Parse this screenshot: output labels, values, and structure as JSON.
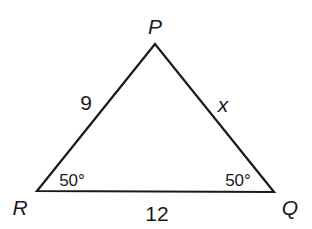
{
  "diagram": {
    "type": "triangle",
    "vertices": {
      "P": {
        "label": "P"
      },
      "R": {
        "label": "R"
      },
      "Q": {
        "label": "Q"
      }
    },
    "sides": {
      "PR": {
        "label": "9"
      },
      "PQ": {
        "label": "x"
      },
      "RQ": {
        "label": "12"
      }
    },
    "angles": {
      "R": {
        "label": "50°"
      },
      "Q": {
        "label": "50°"
      }
    },
    "stroke_color": "#1a1a1a"
  }
}
